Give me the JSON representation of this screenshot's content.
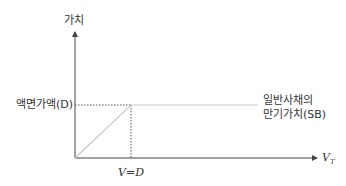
{
  "diagram": {
    "y_axis_label": "가치",
    "x_axis_label": "V",
    "x_axis_subscript": "T",
    "face_value_label": "액면가액(D)",
    "x_tick_label": "V=D",
    "line_label_line1": "일반사채의",
    "line_label_line2": "만기가치(SB)",
    "colors": {
      "axis": "#444444",
      "payoff_line": "#c8c8c8",
      "dotted_guides": "#555555"
    }
  }
}
